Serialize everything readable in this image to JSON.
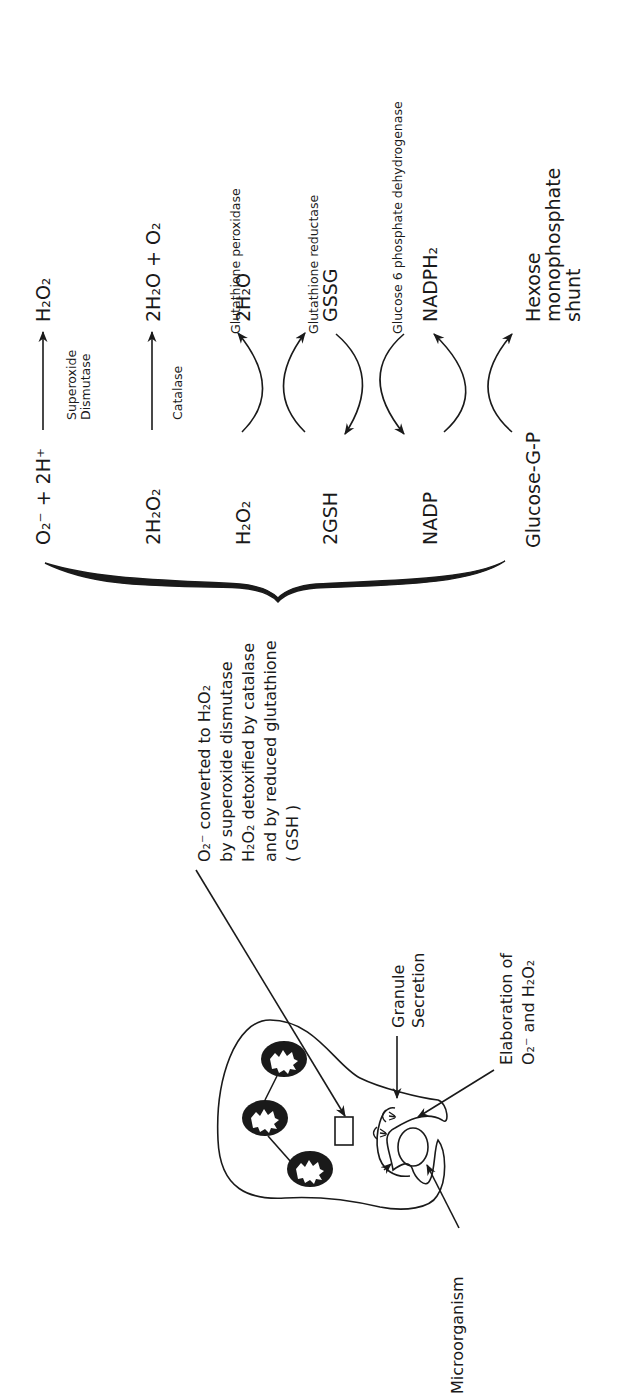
{
  "figure": {
    "orientation": "rotated-90-ccw",
    "reactions": {
      "superoxide": {
        "reactant": "O₂⁻ + 2H⁺",
        "product": "H₂O₂",
        "enzyme_line1": "Superoxide",
        "enzyme_line2": "Dismutase"
      },
      "catalase": {
        "reactant": "2H₂O₂",
        "product": "2H₂O + O₂",
        "enzyme": "Catalase"
      }
    },
    "cycles": [
      {
        "left": "H₂O₂",
        "right": "2H₂O",
        "enzyme": "Glutathione peroxidase"
      },
      {
        "left": "2GSH",
        "right": "GSSG",
        "enzyme": "Glutathione reductase"
      },
      {
        "left": "NADP",
        "right": "NADPH₂",
        "enzyme": "Glucose 6 phosphate dehydrogenase"
      },
      {
        "left": "Glucose-G-P",
        "right_line1": "Hexose",
        "right_line2": "monophosphate",
        "right_line3": "shunt"
      }
    ],
    "explanation": {
      "line1": "O₂⁻ converted to H₂O₂",
      "line2": "by superoxide dismutase",
      "line3": "H₂O₂ detoxified by catalase",
      "line4": "and by reduced glutathione",
      "line5": "( GSH )"
    },
    "cell_labels": {
      "granule_line1": "Granule",
      "granule_line2": "Secretion",
      "elaboration_line1": "Elaboration of",
      "elaboration_line2": "O₂⁻ and H₂O₂",
      "microorganism": "Microorganism"
    }
  }
}
